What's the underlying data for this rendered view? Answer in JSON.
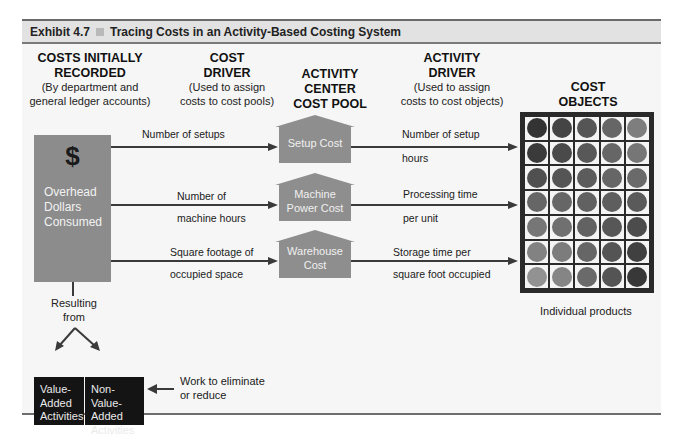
{
  "exhibit": {
    "number": "Exhibit 4.7",
    "title": "Tracing Costs in an Activity-Based Costing System"
  },
  "columns": {
    "costs_recorded": {
      "heading_line1": "COSTS INITIALLY",
      "heading_line2": "RECORDED",
      "sub_line1": "(By department and",
      "sub_line2": "general ledger accounts)"
    },
    "cost_driver": {
      "heading_line1": "COST",
      "heading_line2": "DRIVER",
      "sub_line1": "(Used to assign",
      "sub_line2": "costs to cost pools)"
    },
    "activity_center": {
      "heading_line1": "ACTIVITY",
      "heading_line2": "CENTER",
      "heading_line3": "COST POOL"
    },
    "activity_driver": {
      "heading_line1": "ACTIVITY",
      "heading_line2": "DRIVER",
      "sub_line1": "(Used to assign",
      "sub_line2": "costs to cost objects)"
    },
    "cost_objects": {
      "heading_line1": "COST",
      "heading_line2": "OBJECTS",
      "caption": "Individual products"
    }
  },
  "overhead_box": {
    "symbol": "$",
    "line1": "Overhead",
    "line2": "Dollars",
    "line3": "Consumed"
  },
  "rows": [
    {
      "cost_driver_line1": "Number of setups",
      "cost_driver_line2": "",
      "pool_line1": "Setup Cost",
      "pool_line2": "",
      "activity_driver_line1": "Number of setup",
      "activity_driver_line2": "hours"
    },
    {
      "cost_driver_line1": "Number of",
      "cost_driver_line2": "machine hours",
      "pool_line1": "Machine",
      "pool_line2": "Power Cost",
      "activity_driver_line1": "Processing time",
      "activity_driver_line2": "per unit"
    },
    {
      "cost_driver_line1": "Square footage of",
      "cost_driver_line2": "occupied space",
      "pool_line1": "Warehouse",
      "pool_line2": "Cost",
      "activity_driver_line1": "Storage time per",
      "activity_driver_line2": "square foot occupied"
    }
  ],
  "resulting": {
    "line1": "Resulting",
    "line2": "from"
  },
  "activities": {
    "value_added": {
      "line1": "Value-",
      "line2": "Added",
      "line3": "Activities"
    },
    "non_value_added": {
      "line1": "Non-Value-",
      "line2": "Added",
      "line3": "Activities"
    },
    "note_line1": "Work to eliminate",
    "note_line2": "or reduce"
  },
  "product_grid": {
    "columns": 5,
    "rows": 7,
    "colors": [
      [
        "#333333",
        "#444444",
        "#555555",
        "#666666",
        "#7e7e7e"
      ],
      [
        "#3a3a3a",
        "#4a4a4a",
        "#585858",
        "#666666",
        "#767676"
      ],
      [
        "#505050",
        "#555555",
        "#5c5c5c",
        "#666666",
        "#6a6a6a"
      ],
      [
        "#666666",
        "#666666",
        "#616161",
        "#5e5e5e",
        "#5a5a5a"
      ],
      [
        "#767676",
        "#707070",
        "#626262",
        "#575757",
        "#4c4c4c"
      ],
      [
        "#828282",
        "#7c7c7c",
        "#666666",
        "#545454",
        "#404040"
      ],
      [
        "#929292",
        "#858585",
        "#6a6a6a",
        "#545454",
        "#383838"
      ]
    ]
  },
  "colors": {
    "title_bar": "#e2e2e2",
    "panel": "#f6f6f6",
    "overhead_box": "#8c8c8c",
    "pool_house": "#8e8e8e",
    "activity_box": "#141414",
    "grid_frame": "#2a2a2a"
  }
}
